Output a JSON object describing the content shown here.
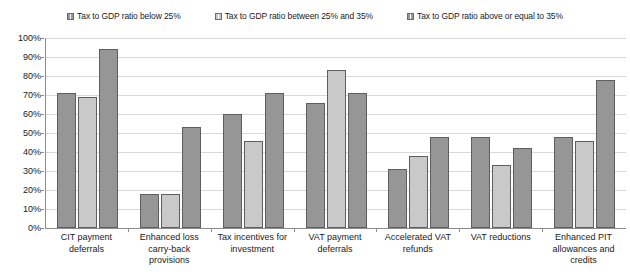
{
  "chart_data": {
    "type": "bar",
    "title": "",
    "xlabel": "",
    "ylabel": "",
    "ylim": [
      0,
      100
    ],
    "grid": true,
    "legend_position": "top",
    "y_ticks": [
      "0%",
      "10%",
      "20%",
      "30%",
      "40%",
      "50%",
      "60%",
      "70%",
      "80%",
      "90%",
      "100%"
    ],
    "categories": [
      "CIT payment deferrals",
      "Enhanced loss carry-back provisions",
      "Tax incentives for investment",
      "VAT payment deferrals",
      "Accelerated VAT refunds",
      "VAT reductions",
      "Enhanced PIT allowances and credits"
    ],
    "series": [
      {
        "name": "Tax to GDP ratio below 25%",
        "color": "#969696",
        "values": [
          71,
          18,
          60,
          66,
          31,
          48,
          48
        ]
      },
      {
        "name": "Tax to GDP ratio between 25% and 35%",
        "color": "#c9c9c9",
        "values": [
          69,
          18,
          46,
          83,
          38,
          33,
          46
        ]
      },
      {
        "name": "Tax to GDP ratio above or equal to 35%",
        "color": "#969696",
        "values": [
          94,
          53,
          71,
          71,
          48,
          42,
          78
        ]
      }
    ]
  },
  "legend": {
    "items": [
      {
        "label": "Tax to GDP ratio below 25%"
      },
      {
        "label": "Tax to GDP ratio between 25% and 35%"
      },
      {
        "label": "Tax to GDP ratio above or equal to 35%"
      }
    ]
  },
  "axis": {
    "y_labels": [
      "100%",
      "90%",
      "80%",
      "70%",
      "60%",
      "50%",
      "40%",
      "30%",
      "20%",
      "10%",
      "0%"
    ],
    "x_labels": [
      "CIT payment deferrals",
      "Enhanced loss carry-back provisions",
      "Tax incentives for investment",
      "VAT payment deferrals",
      "Accelerated VAT refunds",
      "VAT reductions",
      "Enhanced PIT allowances and credits"
    ]
  }
}
